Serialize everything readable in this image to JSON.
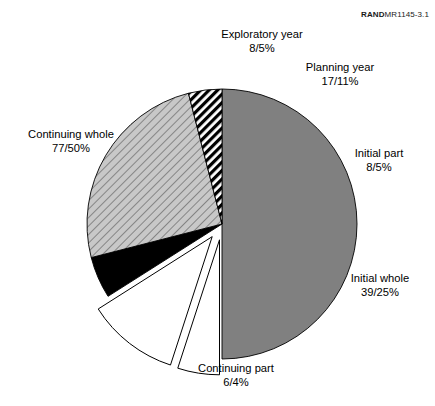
{
  "figure": {
    "header_brand": "RAND",
    "header_id": "MR1145-3.1"
  },
  "chart_data": {
    "type": "pie",
    "title": "",
    "xlabel": "",
    "ylabel": "",
    "legend_position": "annotations",
    "grid": false,
    "total_count": 155,
    "categories": [
      "Continuing whole",
      "Exploratory year",
      "Planning year",
      "Initial part",
      "Initial whole",
      "Continuing part"
    ],
    "values": [
      50,
      5,
      11,
      5,
      25,
      4
    ],
    "counts": [
      77,
      8,
      17,
      8,
      39,
      6
    ],
    "slices": [
      {
        "name": "Continuing whole",
        "label_line1": "Continuing whole",
        "label_line2": "77/50%",
        "count": 77,
        "percent": 50,
        "fill": "#808080",
        "pattern": "solid",
        "exploded": false,
        "start_angle": 0,
        "end_angle": 180
      },
      {
        "name": "Exploratory year",
        "label_line1": "Exploratory year",
        "label_line2": "8/5%",
        "count": 8,
        "percent": 5,
        "fill": "#ffffff",
        "pattern": "solid",
        "exploded": true,
        "start_angle": 180,
        "end_angle": 198
      },
      {
        "name": "Planning year",
        "label_line1": "Planning year",
        "label_line2": "17/11%",
        "count": 17,
        "percent": 11,
        "fill": "#ffffff",
        "pattern": "solid",
        "exploded": true,
        "start_angle": 198,
        "end_angle": 237.6
      },
      {
        "name": "Initial part",
        "label_line1": "Initial part",
        "label_line2": "8/5%",
        "count": 8,
        "percent": 5,
        "fill": "#000000",
        "pattern": "solid",
        "exploded": false,
        "start_angle": 237.6,
        "end_angle": 255.6
      },
      {
        "name": "Initial whole",
        "label_line1": "Initial whole",
        "label_line2": "39/25%",
        "count": 39,
        "percent": 25,
        "fill": "#c8c8c8",
        "pattern": "diagonal-lines",
        "exploded": false,
        "start_angle": 255.6,
        "end_angle": 345.6
      },
      {
        "name": "Continuing part",
        "label_line1": "Continuing part",
        "label_line2": "6/4%",
        "count": 6,
        "percent": 4,
        "fill": "#ffffff",
        "pattern": "diagonal-stripes-black",
        "exploded": false,
        "start_angle": 345.6,
        "end_angle": 360
      }
    ]
  }
}
